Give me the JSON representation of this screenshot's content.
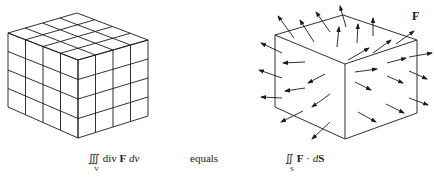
{
  "diagram": {
    "left": {
      "description": "solid cube subdivided into 4x4x4 small cubes",
      "divisions": 4,
      "formula": {
        "integral": "∭",
        "integrand": "div ",
        "field": "F",
        "differential": " dv",
        "subscript": "V"
      }
    },
    "middle": {
      "connector": "equals"
    },
    "right": {
      "description": "cube with outward-pointing flux arrows on its surface",
      "vector_label": "F",
      "formula": {
        "integral": "∬",
        "field": "F",
        "operator": " · ",
        "differential_prefix": "d",
        "differential": "S",
        "subscript": "S"
      }
    },
    "caption": ""
  },
  "colors": {
    "ink": "#1a1a1a",
    "background": "#ffffff"
  }
}
